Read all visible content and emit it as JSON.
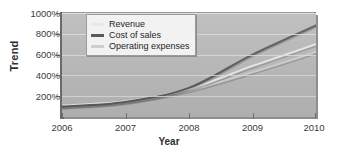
{
  "chart_data": {
    "type": "line",
    "title": "",
    "xlabel": "Year",
    "ylabel": "Trend",
    "x": [
      2006,
      2007,
      2008,
      2009,
      2010
    ],
    "xtick_labels": [
      "2006",
      "2007",
      "2008",
      "2009",
      "2010"
    ],
    "ytick_labels": [
      "200%",
      "400%",
      "600%",
      "800%",
      "1000%"
    ],
    "ytick_values": [
      200,
      400,
      600,
      800,
      1000
    ],
    "ylim": [
      0,
      1000
    ],
    "xlim": [
      2006,
      2010
    ],
    "grid": "horizontal",
    "legend_position": "upper-left-inside",
    "series": [
      {
        "name": "Revenue",
        "color": "#e8e8e8",
        "values": [
          110,
          150,
          270,
          490,
          700
        ]
      },
      {
        "name": "Cost of sales",
        "color": "#5a5a5a",
        "values": [
          100,
          145,
          280,
          600,
          880
        ]
      },
      {
        "name": "Operating expenses",
        "color": "#cfcfcf",
        "values": [
          95,
          140,
          255,
          430,
          625
        ]
      }
    ]
  },
  "legend": {
    "items": [
      {
        "label": "Revenue"
      },
      {
        "label": "Cost of sales"
      },
      {
        "label": "Operating expenses"
      }
    ]
  },
  "axes": {
    "y_title": "Trend",
    "x_title": "Year"
  },
  "colors": {
    "plot_background": "#b9b9b9",
    "gridline": "#dedede",
    "axis": "#6a6a6a",
    "legend_background": "#f2f2f2",
    "text": "#2e2e2e"
  }
}
